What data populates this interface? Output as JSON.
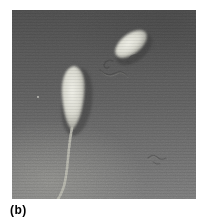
{
  "figure": {
    "label": "(b)",
    "alt": "Grayscale micrograph of two sperm-like cells: bright oval heads, the left cell with a long beaded tail, faint tail fragments near the upper-right cell"
  },
  "photo": {
    "colors": {
      "bg_top": "#4e4e4e",
      "bg_mid": "#616161",
      "bg_bottom": "#7b7b7b",
      "corner_light": "#a0a09a",
      "head_core": "#eeeee6",
      "head_mid": "#d8d8ce",
      "head_edge": "#92928a",
      "shadow_dark": "#3a3a3a",
      "tail_light": "#b6b6ac",
      "squiggle_dark": "#464646",
      "squiggle_light": "#9a9a92",
      "speck_light": "#cfcfc7"
    }
  }
}
